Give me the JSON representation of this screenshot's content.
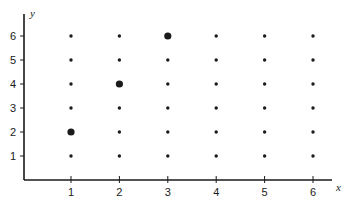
{
  "chart_data": {
    "type": "scatter",
    "title": "",
    "xlabel": "x",
    "ylabel": "y",
    "xlim": [
      0,
      6.5
    ],
    "ylim": [
      0,
      6.5
    ],
    "grid": false,
    "x_ticks": [
      "1",
      "2",
      "3",
      "4",
      "5",
      "6"
    ],
    "y_ticks": [
      "1",
      "2",
      "3",
      "4",
      "5",
      "6"
    ],
    "series": [
      {
        "name": "lattice points",
        "marker": "small",
        "points": [
          [
            1,
            1
          ],
          [
            1,
            3
          ],
          [
            1,
            4
          ],
          [
            1,
            5
          ],
          [
            1,
            6
          ],
          [
            2,
            1
          ],
          [
            2,
            2
          ],
          [
            2,
            3
          ],
          [
            2,
            5
          ],
          [
            2,
            6
          ],
          [
            3,
            1
          ],
          [
            3,
            2
          ],
          [
            3,
            3
          ],
          [
            3,
            4
          ],
          [
            3,
            5
          ],
          [
            4,
            1
          ],
          [
            4,
            2
          ],
          [
            4,
            3
          ],
          [
            4,
            4
          ],
          [
            4,
            5
          ],
          [
            4,
            6
          ],
          [
            5,
            1
          ],
          [
            5,
            2
          ],
          [
            5,
            3
          ],
          [
            5,
            4
          ],
          [
            5,
            5
          ],
          [
            5,
            6
          ],
          [
            6,
            1
          ],
          [
            6,
            2
          ],
          [
            6,
            3
          ],
          [
            6,
            4
          ],
          [
            6,
            5
          ],
          [
            6,
            6
          ]
        ]
      },
      {
        "name": "highlighted points",
        "marker": "large",
        "points": [
          [
            1,
            2
          ],
          [
            2,
            4
          ],
          [
            3,
            6
          ]
        ]
      }
    ]
  },
  "axes": {
    "x_label": "x",
    "y_label": "y",
    "x_tick_labels": [
      "1",
      "2",
      "3",
      "4",
      "5",
      "6"
    ],
    "y_tick_labels": [
      "1",
      "2",
      "3",
      "4",
      "5",
      "6"
    ]
  },
  "colors": {
    "ink": "#1a1a1a",
    "background": "#ffffff"
  }
}
